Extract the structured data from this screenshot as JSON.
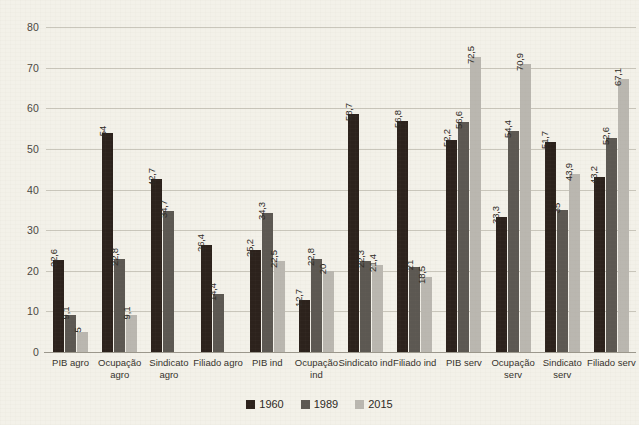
{
  "chart_data": {
    "type": "bar",
    "title": "",
    "subtitle": "",
    "xlabel": "",
    "ylabel": "",
    "ylim": [
      0,
      80
    ],
    "yticks": [
      0,
      10,
      20,
      30,
      40,
      50,
      60,
      70,
      80
    ],
    "grid": true,
    "legend_position": "bottom",
    "categories": [
      "PIB agro",
      "Ocupação agro",
      "Sindicato agro",
      "Filiado agro",
      "PIB ind",
      "Ocupação ind",
      "Sindicato ind",
      "Filiado ind",
      "PIB serv",
      "Ocupação serv",
      "Sindicato serv",
      "Filiado serv"
    ],
    "series": [
      {
        "name": "1960",
        "color": "#2c221c",
        "values": [
          22.6,
          54,
          42.7,
          26.4,
          25.2,
          12.7,
          58.7,
          56.8,
          52.2,
          33.3,
          51.7,
          43.2
        ],
        "labels": [
          "22,6",
          "54",
          "42,7",
          "26,4",
          "25,2",
          "12,7",
          "58,7",
          "56,8",
          "52,2",
          "33,3",
          "51,7",
          "43,2"
        ]
      },
      {
        "name": "1989",
        "color": "#5c5852",
        "values": [
          9.1,
          22.8,
          34.7,
          14.4,
          34.3,
          22.8,
          22.3,
          21,
          56.6,
          54.4,
          35,
          52.6
        ],
        "labels": [
          "9,1",
          "22,8",
          "34,7",
          "14,4",
          "34,3",
          "22,8",
          "22,3",
          "21",
          "56,6",
          "54,4",
          "35",
          "52,6"
        ]
      },
      {
        "name": "2015",
        "color": "#bab7b0",
        "values": [
          5,
          9.1,
          null,
          null,
          22.5,
          20,
          21.4,
          18.5,
          72.5,
          70.9,
          43.9,
          67.1
        ],
        "labels": [
          "5",
          "9,1",
          "",
          "",
          "22,5",
          "20",
          "21,4",
          "18,5",
          "72,5",
          "70,9",
          "43,9",
          "67,1"
        ]
      }
    ]
  },
  "legend": {
    "items": [
      {
        "label": "1960",
        "swatch": "s0"
      },
      {
        "label": "1989",
        "swatch": "s1"
      },
      {
        "label": "2015",
        "swatch": "s2"
      }
    ]
  },
  "colors": {
    "background": "#f3f1e9",
    "gridline": "#c9c6bb",
    "axis": "#9b978c",
    "series_1960": "#2c221c",
    "series_1989": "#5c5852",
    "series_2015": "#bab7b0",
    "text": "#2d2924"
  }
}
